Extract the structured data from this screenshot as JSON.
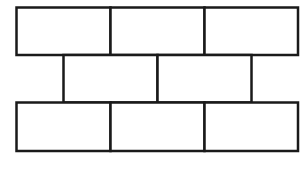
{
  "diagram": {
    "title": "",
    "type": "brick-wall-pattern",
    "stroke_color": "#1a1a1a",
    "background": "#ffffff",
    "rows": [
      {
        "name": "top-row",
        "bricks": 3
      },
      {
        "name": "middle-row",
        "bricks": 2
      },
      {
        "name": "bottom-row",
        "bricks": 3
      }
    ]
  }
}
